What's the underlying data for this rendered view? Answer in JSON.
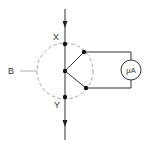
{
  "diagram": {
    "type": "circuit",
    "labels": {
      "top_node": "X",
      "bottom_node": "Y",
      "boundary": "B",
      "meter": "μA"
    },
    "colors": {
      "wire": "#333333",
      "boundary": "#9a9a9a",
      "node": "#111111",
      "background": "#ffffff"
    },
    "elements": [
      {
        "id": "main-wire",
        "kind": "wire",
        "direction": "vertical",
        "arrows": [
          "down",
          "down"
        ]
      },
      {
        "id": "node-x",
        "kind": "node",
        "label": "X"
      },
      {
        "id": "node-y",
        "kind": "node",
        "label": "Y"
      },
      {
        "id": "center-node",
        "kind": "node"
      },
      {
        "id": "branch-upper",
        "kind": "wire"
      },
      {
        "id": "branch-lower",
        "kind": "wire"
      },
      {
        "id": "boundary-b",
        "kind": "dashed-circle",
        "label": "B"
      },
      {
        "id": "microammeter",
        "kind": "meter",
        "label": "μA"
      }
    ]
  }
}
